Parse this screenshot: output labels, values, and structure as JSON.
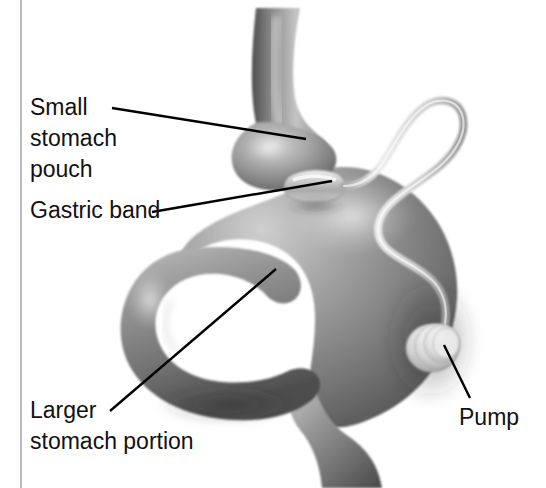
{
  "figure": {
    "width": 546,
    "height": 488,
    "background_color": "#ffffff",
    "style": "grayscale airbrush medical illustration"
  },
  "frame": {
    "left_rule_color": "#b9b9b9",
    "left_rule_x": 21
  },
  "labels": [
    {
      "id": "small-stomach-pouch",
      "lines": [
        "Small",
        "stomach",
        "pouch"
      ],
      "line1": "Small",
      "line2": "stomach",
      "line3": "pouch",
      "x": 30,
      "y": 115,
      "leader": {
        "x1": 112,
        "y1": 108,
        "x2": 306,
        "y2": 139
      }
    },
    {
      "id": "gastric-band",
      "lines": [
        "Gastric band"
      ],
      "line1": "Gastric band",
      "x": 30,
      "y": 218,
      "leader": {
        "x1": 152,
        "y1": 212,
        "x2": 332,
        "y2": 181
      }
    },
    {
      "id": "larger-stomach-portion",
      "lines": [
        "Larger",
        "stomach portion"
      ],
      "line1": "Larger",
      "line2": "stomach portion",
      "x": 30,
      "y": 418,
      "leader": {
        "x1": 110,
        "y1": 411,
        "x2": 276,
        "y2": 269
      }
    },
    {
      "id": "pump",
      "lines": [
        "Pump"
      ],
      "line1": "Pump",
      "x": 459,
      "y": 425,
      "leader": {
        "x1": 470,
        "y1": 398,
        "x2": 444,
        "y2": 345
      }
    }
  ],
  "anatomy": {
    "esophagus": {
      "name": "esophagus",
      "fill": "#8f8f8f"
    },
    "small_pouch": {
      "name": "small stomach pouch",
      "fill": "#9b9b9b"
    },
    "band": {
      "name": "gastric band",
      "fill": "#d6d6d6"
    },
    "stomach_body": {
      "name": "larger stomach portion",
      "fill": "#8a8a8a"
    },
    "duodenum": {
      "name": "duodenum loop",
      "fill": "#939393"
    },
    "tube": {
      "name": "connecting tube",
      "fill": "#d8d8d8"
    },
    "pump": {
      "name": "pump reservoir",
      "fill": "#d2d2d2"
    }
  },
  "colors": {
    "ink": "#111111",
    "leader": "#000000",
    "tissue_light": "#c9c9c9",
    "tissue_mid": "#8c8c8c",
    "tissue_dark": "#4a4a4a",
    "device_light": "#e4e4e4",
    "device_mid": "#bdbdbd"
  }
}
